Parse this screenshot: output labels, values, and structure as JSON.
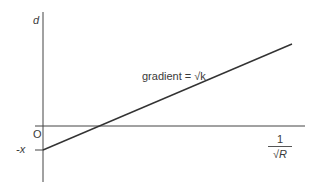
{
  "diagram": {
    "y_axis_label": "d",
    "x_axis_label_numerator": "1",
    "x_axis_label_denominator": "√R",
    "origin_label": "O",
    "intercept_label": "-x",
    "line_annotation": "gradient = √k",
    "colors": {
      "axis": "#444444",
      "line": "#333333",
      "text": "#3a3a3a"
    },
    "geometry": {
      "y_axis": {
        "x": 43,
        "y1": 12,
        "y2": 182
      },
      "x_axis": {
        "y": 126,
        "x1": 35,
        "x2": 305
      },
      "intercept_tick": {
        "y": 150,
        "x1": 35,
        "x2": 43
      },
      "line": {
        "x1": 43,
        "y1": 150,
        "x2": 292,
        "y2": 44
      }
    }
  }
}
